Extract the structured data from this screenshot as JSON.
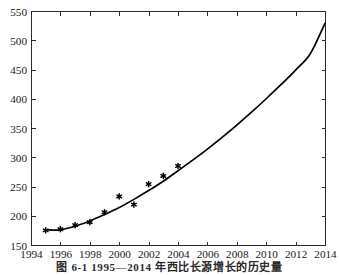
{
  "figure": {
    "caption": "图 6-1  1995—2014 年西比长源增长的历史量",
    "background_color": "#ffffff",
    "axis_color": "#2b2b2b",
    "curve_color": "#000000",
    "marker_color": "#000000"
  },
  "chart_data": {
    "type": "scatter",
    "title": "",
    "subtitle": "",
    "xlabel": "",
    "ylabel": "",
    "xlim": [
      1994,
      2014
    ],
    "ylim": [
      150,
      550
    ],
    "grid": false,
    "legend": null,
    "legend_position": "none",
    "x_ticks": [
      1994,
      1996,
      1998,
      2000,
      2002,
      2004,
      2006,
      2008,
      2010,
      2012,
      2014
    ],
    "x_tick_labels": [
      "1994",
      "1996",
      "1998",
      "2000",
      "2002",
      "2004",
      "2006",
      "2008",
      "2010",
      "2012",
      "2014"
    ],
    "y_ticks": [
      150,
      200,
      250,
      300,
      350,
      400,
      450,
      500,
      550
    ],
    "y_tick_labels": [
      "150",
      "200",
      "250",
      "300",
      "350",
      "400",
      "450",
      "500",
      "550"
    ],
    "series": [
      {
        "name": "observed",
        "type": "scatter",
        "marker": "asterisk",
        "x": [
          1995,
          1996,
          1997,
          1998,
          1999,
          2000,
          2001,
          2002,
          2003,
          2004
        ],
        "values": [
          175,
          177,
          184,
          189,
          206,
          233,
          219,
          254,
          268,
          285
        ]
      },
      {
        "name": "fitted",
        "type": "line",
        "x": [
          1995,
          1996,
          1997,
          1998,
          1999,
          2000,
          2001,
          2002,
          2003,
          2004,
          2005,
          2006,
          2007,
          2008,
          2009,
          2010,
          2011,
          2012,
          2013,
          2014
        ],
        "values": [
          176,
          176,
          182,
          191,
          202,
          214,
          228,
          243,
          259,
          277,
          295,
          314,
          334,
          355,
          377,
          400,
          424,
          449,
          477,
          529
        ]
      }
    ]
  }
}
